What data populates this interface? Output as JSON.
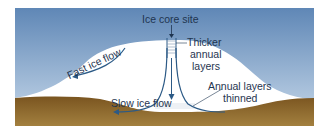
{
  "diagram": {
    "colors": {
      "sky_top": "#5f87b6",
      "sky_bottom": "#c9daeb",
      "ice": "#ffffff",
      "bedrock_top": "#7a5520",
      "bedrock_bottom": "#a07a3c",
      "flow_line": "#2c5a86",
      "label_text": "#1f3550"
    },
    "labels": {
      "ice_core_site": "Ice core site",
      "thicker_annual_layers": [
        "Thicker",
        "annual",
        "layers"
      ],
      "fast_ice_flow": "Fast ice flow",
      "slow_ice_flow": "Slow ice flow",
      "annual_layers_thinned": [
        "Annual layers",
        "thinned"
      ]
    }
  }
}
